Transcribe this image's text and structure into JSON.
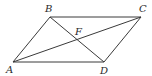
{
  "diagram": {
    "type": "parallelogram-with-diagonals",
    "points": {
      "A": {
        "label": "A",
        "x": 13,
        "y": 62
      },
      "B": {
        "label": "B",
        "x": 50,
        "y": 17
      },
      "C": {
        "label": "C",
        "x": 141,
        "y": 17
      },
      "D": {
        "label": "D",
        "x": 104,
        "y": 62
      },
      "F": {
        "label": "F",
        "x": 77,
        "y": 40
      }
    },
    "segments": [
      "AB",
      "BC",
      "CD",
      "DA",
      "AC",
      "BD"
    ],
    "labels": {
      "A": "A",
      "B": "B",
      "C": "C",
      "D": "D",
      "F": "F"
    },
    "colors": {
      "line": "#3a3a3a",
      "text": "#2a2a2a",
      "background": "#ffffff"
    }
  }
}
